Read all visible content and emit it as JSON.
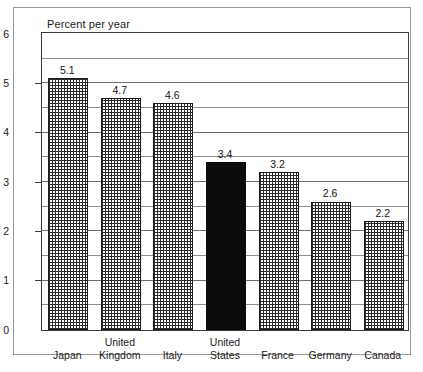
{
  "figure": {
    "title": "Percent per year"
  },
  "chart_data": {
    "type": "bar",
    "title": "Percent per year",
    "xlabel": "",
    "ylabel": "Percent per year",
    "ylim": [
      0,
      6
    ],
    "ytick_labels": [
      "0",
      "1",
      "2",
      "3",
      "4",
      "5",
      "6"
    ],
    "ytick_values": [
      0,
      1,
      2,
      3,
      4,
      5,
      6
    ],
    "gridline_interval": 0.5,
    "grid": true,
    "legend": "none",
    "categories": [
      "Japan",
      "United Kingdom",
      "Italy",
      "United States",
      "France",
      "Germany",
      "Canada"
    ],
    "category_lines": [
      [
        "Japan"
      ],
      [
        "United",
        "Kingdom"
      ],
      [
        "Italy"
      ],
      [
        "United",
        "States"
      ],
      [
        "France"
      ],
      [
        "Germany"
      ],
      [
        "Canada"
      ]
    ],
    "values": [
      5.1,
      4.7,
      4.6,
      3.4,
      3.2,
      2.6,
      2.2
    ],
    "value_labels": [
      "5.1",
      "4.7",
      "4.6",
      "3.4",
      "3.2",
      "2.6",
      "2.2"
    ],
    "bar_styles": [
      "crosshatch",
      "crosshatch",
      "crosshatch",
      "solid",
      "crosshatch",
      "crosshatch",
      "crosshatch"
    ],
    "highlight_category": "United States",
    "colors": {
      "highlight_fill": "#0b0b0b",
      "bar_outline": "#1c1c1c",
      "pattern_ink": "#2b2b2b",
      "plot_frame": "#3a3a3a",
      "gridline": "#6e6e6e",
      "outer_border": "#9a9a9a",
      "background": "#ffffff",
      "text": "#1a1a1a"
    }
  }
}
